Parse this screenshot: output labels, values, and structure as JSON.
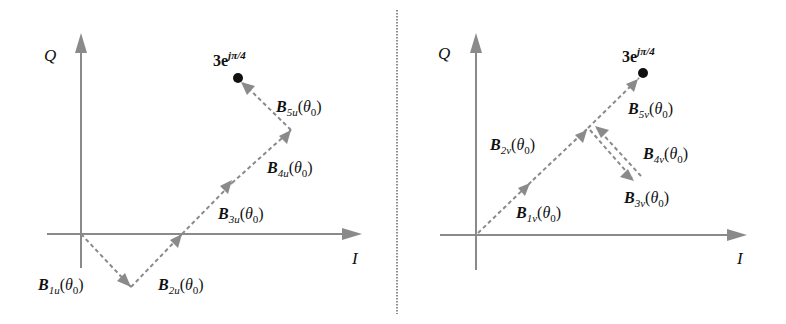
{
  "panels": [
    {
      "id": "left",
      "axes": {
        "x_label": "I",
        "y_label": "Q"
      },
      "target_point": {
        "base": "3e",
        "exponent": "jπ/4"
      },
      "vectors": [
        {
          "name": "B",
          "sub": "1u",
          "arg": "θ",
          "arg_sub": "0"
        },
        {
          "name": "B",
          "sub": "2u",
          "arg": "θ",
          "arg_sub": "0"
        },
        {
          "name": "B",
          "sub": "3u",
          "arg": "θ",
          "arg_sub": "0"
        },
        {
          "name": "B",
          "sub": "4u",
          "arg": "θ",
          "arg_sub": "0"
        },
        {
          "name": "B",
          "sub": "5u",
          "arg": "θ",
          "arg_sub": "0"
        }
      ]
    },
    {
      "id": "right",
      "axes": {
        "x_label": "I",
        "y_label": "Q"
      },
      "target_point": {
        "base": "3e",
        "exponent": "jπ/4"
      },
      "vectors": [
        {
          "name": "B",
          "sub": "1ν",
          "arg": "θ",
          "arg_sub": "0"
        },
        {
          "name": "B",
          "sub": "2ν",
          "arg": "θ",
          "arg_sub": "0"
        },
        {
          "name": "B",
          "sub": "3ν",
          "arg": "θ",
          "arg_sub": "0"
        },
        {
          "name": "B",
          "sub": "4ν",
          "arg": "θ",
          "arg_sub": "0"
        },
        {
          "name": "B",
          "sub": "5ν",
          "arg": "θ",
          "arg_sub": "0"
        }
      ]
    }
  ],
  "colors": {
    "axis": "#8a8a8a",
    "vector": "#8a8a8a",
    "point": "#111111",
    "divider": "#666666"
  }
}
